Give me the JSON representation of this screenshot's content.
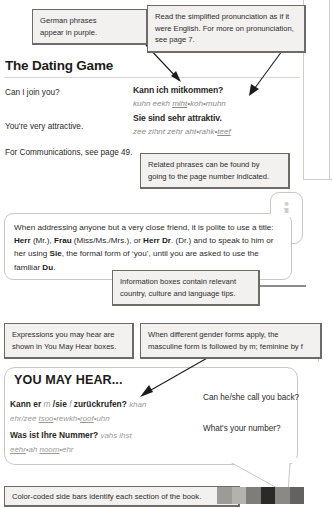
{
  "section": {
    "title": "The Dating Game",
    "rows": [
      {
        "english": "Can I join you?",
        "german": "Kann ich mitkommen?",
        "pronunciation": "kuhn eekh miht•koh•muhn"
      },
      {
        "english": "You're very attractive.",
        "german": "Sie sind sehr attraktiv.",
        "pronunciation": "zee zihnt zehr aht•rahk•teef"
      }
    ],
    "cross_reference": "For Communications, see page 49."
  },
  "callouts": [
    {
      "name": "callout-purple-phrases",
      "lines": [
        "German phrases",
        "appear in purple."
      ]
    },
    {
      "name": "callout-pronunciation",
      "lines": [
        "Read the simplified pronunciation as if it",
        "were English. For more on pronunciation,",
        "see page 7."
      ]
    },
    {
      "name": "callout-related-phrases",
      "lines": [
        "Related phrases can be found by",
        "going to the page number indicated."
      ]
    },
    {
      "name": "callout-information-boxes",
      "lines": [
        "Information boxes contain relevant",
        "country, culture and language tips."
      ]
    },
    {
      "name": "callout-you-may-hear",
      "lines": [
        "Expressions you may hear are",
        "shown in You May Hear boxes."
      ]
    },
    {
      "name": "callout-gender-forms",
      "lines": [
        "When different gender forms apply, the",
        "masculine form is followed by m; feminine by f"
      ]
    }
  ],
  "info_box": {
    "icon": "info-icon",
    "text_segments": [
      {
        "t": "When addressing anyone but a very close friend, it is polite to use a title: ",
        "b": false
      },
      {
        "t": "Herr",
        "b": true
      },
      {
        "t": " (Mr.), ",
        "b": false
      },
      {
        "t": "Frau",
        "b": true
      },
      {
        "t": " (Miss/Ms./Mrs.), or ",
        "b": false
      },
      {
        "t": "Herr Dr",
        "b": true
      },
      {
        "t": ". (Dr.) and to speak to him or her using ",
        "b": false
      },
      {
        "t": "Sie",
        "b": true
      },
      {
        "t": ", the formal form of ‘you’, until you are asked to use the familiar ",
        "b": false
      },
      {
        "t": "Du",
        "b": true
      },
      {
        "t": ".",
        "b": false
      }
    ]
  },
  "you_may_hear": {
    "title": "YOU MAY HEAR...",
    "rows": [
      {
        "german_pre": "Kann er ",
        "gender_m": "m",
        "german_mid": " /sie ",
        "gender_f": "f",
        "german_post": " zurückrufen?",
        "pronunciation": "khan ehr/zee tsoo•rewkh•roof•uhn",
        "english": "Can he/she call you back?"
      },
      {
        "german_pre": "Was ist Ihre Nummer?",
        "gender_m": "",
        "german_mid": "",
        "gender_f": "",
        "german_post": "",
        "pronunciation": "vahs ihst eehr•ah noom•ehr",
        "english": "What's your number?"
      }
    ]
  },
  "bottom_caption": {
    "text": "Color-coded side bars identify each section of the book.",
    "swatch_colors": [
      "#9d9b98",
      "#b4b2af",
      "#7f7d7a",
      "#2b2a29",
      "#8b8986",
      "#636260"
    ]
  }
}
